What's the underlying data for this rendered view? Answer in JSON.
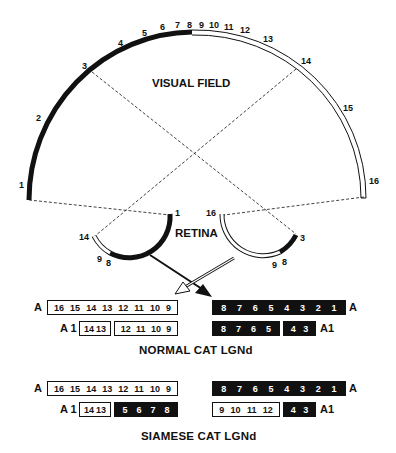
{
  "visual_field": {
    "title": "VISUAL FIELD",
    "positions": [
      "1",
      "2",
      "3",
      "4",
      "5",
      "6",
      "7",
      "8",
      "9",
      "10",
      "11",
      "12",
      "13",
      "14",
      "15",
      "16"
    ],
    "black_segment": "1-8",
    "white_segment": "8-16"
  },
  "retina": {
    "title": "RETINA",
    "left_eye": {
      "labels": {
        "top": "1",
        "mid_a": "8",
        "mid_b": "9",
        "end": "14"
      }
    },
    "right_eye": {
      "labels": {
        "top": "16",
        "mid_a": "9",
        "mid_b": "8",
        "end": "3"
      }
    }
  },
  "normal": {
    "caption": "NORMAL CAT LGNd",
    "left": {
      "A": {
        "label": "A",
        "boxes": [
          {
            "color": "white",
            "cells": [
              "16",
              "15",
              "14",
              "13",
              "12",
              "11",
              "10",
              "9"
            ]
          }
        ]
      },
      "A1": {
        "label": "A 1",
        "boxes": [
          {
            "color": "white",
            "cells": [
              "14",
              "13"
            ]
          },
          {
            "color": "white",
            "cells": [
              "12",
              "11",
              "10",
              "9"
            ]
          }
        ]
      }
    },
    "right": {
      "A": {
        "label": "A",
        "boxes": [
          {
            "color": "black",
            "cells": [
              "8",
              "7",
              "6",
              "5",
              "4",
              "3",
              "2",
              "1"
            ]
          }
        ]
      },
      "A1": {
        "label": "A1",
        "boxes": [
          {
            "color": "black",
            "cells": [
              "8",
              "7",
              "6",
              "5"
            ]
          },
          {
            "color": "black",
            "cells": [
              "4",
              "3"
            ]
          }
        ]
      }
    }
  },
  "siamese": {
    "caption": "SIAMESE CAT LGNd",
    "left": {
      "A": {
        "label": "A",
        "boxes": [
          {
            "color": "white",
            "cells": [
              "16",
              "15",
              "14",
              "13",
              "12",
              "11",
              "10",
              "9"
            ]
          }
        ]
      },
      "A1": {
        "label": "A 1",
        "boxes": [
          {
            "color": "white",
            "cells": [
              "14",
              "13"
            ]
          },
          {
            "color": "black",
            "cells": [
              "5",
              "6",
              "7",
              "8"
            ]
          }
        ]
      }
    },
    "right": {
      "A": {
        "label": "A",
        "boxes": [
          {
            "color": "black",
            "cells": [
              "8",
              "7",
              "6",
              "5",
              "4",
              "3",
              "2",
              "1"
            ]
          }
        ]
      },
      "A1": {
        "label": "A1",
        "boxes": [
          {
            "color": "white",
            "cells": [
              "9",
              "10",
              "11",
              "12"
            ]
          },
          {
            "color": "black",
            "cells": [
              "4",
              "3"
            ]
          }
        ]
      }
    }
  }
}
